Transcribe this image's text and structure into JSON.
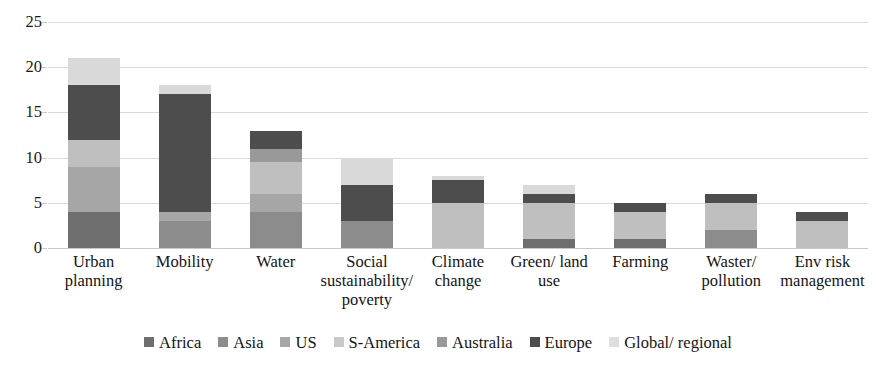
{
  "chart_data": {
    "type": "bar",
    "subtype": "stacked-vertical",
    "title": "",
    "xlabel": "",
    "ylabel": "",
    "ylim": [
      0,
      25
    ],
    "y_ticks": [
      0,
      5,
      10,
      15,
      20,
      25
    ],
    "grid": "horizontal",
    "legend_position": "bottom",
    "categories": [
      "Urban planning",
      "Mobility",
      "Water",
      "Social sustainability/ poverty",
      "Climate change",
      "Green/ land use",
      "Farming",
      "Waster/ pollution",
      "Env risk management"
    ],
    "category_lines": [
      [
        "Urban",
        "planning"
      ],
      [
        "Mobility"
      ],
      [
        "Water"
      ],
      [
        "Social",
        "sustainability/",
        "poverty"
      ],
      [
        "Climate",
        "change"
      ],
      [
        "Green/ land",
        "use"
      ],
      [
        "Farming"
      ],
      [
        "Waster/",
        "pollution"
      ],
      [
        "Env risk",
        "management"
      ]
    ],
    "series": [
      {
        "name": "Africa",
        "color": "#6e6e6e",
        "values": [
          4,
          0,
          0,
          0,
          0,
          1,
          1,
          0,
          0
        ]
      },
      {
        "name": "Asia",
        "color": "#8c8c8c",
        "values": [
          0,
          3,
          4,
          3,
          0,
          0,
          0,
          2,
          0
        ]
      },
      {
        "name": "US",
        "color": "#a6a6a6",
        "values": [
          5,
          1,
          2,
          0,
          0,
          0,
          0,
          0,
          0
        ]
      },
      {
        "name": "S-America",
        "color": "#bfbfbf",
        "values": [
          3,
          0,
          3.5,
          0,
          5,
          4,
          3,
          3,
          3
        ]
      },
      {
        "name": "Australia",
        "color": "#999999",
        "values": [
          0,
          0,
          1.5,
          0,
          0,
          0,
          0,
          0,
          0
        ]
      },
      {
        "name": "Europe",
        "color": "#4d4d4d",
        "values": [
          6,
          13,
          2,
          4,
          2.5,
          1,
          1,
          1,
          1
        ]
      },
      {
        "name": "Global/ regional",
        "color": "#d9d9d9",
        "values": [
          3,
          1,
          0,
          3,
          0.5,
          1,
          0,
          0,
          0
        ]
      }
    ],
    "totals": [
      21,
      18,
      13,
      10,
      8,
      7,
      5,
      6,
      4
    ]
  },
  "axis": {
    "y_tick_labels": [
      "25",
      "20",
      "15",
      "10",
      "5",
      "0"
    ]
  },
  "legend": {
    "items": [
      {
        "label": "Africa",
        "color": "#6e6e6e"
      },
      {
        "label": "Asia",
        "color": "#8c8c8c"
      },
      {
        "label": "US",
        "color": "#a6a6a6"
      },
      {
        "label": "S-America",
        "color": "#c9c9c9"
      },
      {
        "label": "Australia",
        "color": "#999999"
      },
      {
        "label": "Europe",
        "color": "#4d4d4d"
      },
      {
        "label": "Global/ regional",
        "color": "#dedede"
      }
    ]
  }
}
